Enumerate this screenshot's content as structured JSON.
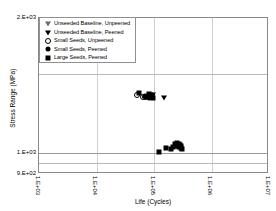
{
  "chart_data": {
    "type": "scatter",
    "title": "",
    "xlabel": "Life (Cycles)",
    "ylabel": "Stress Range (MPa)",
    "xscale": "log",
    "yscale": "log",
    "xlim": [
      1000,
      10000000
    ],
    "ylim": [
      900,
      2000
    ],
    "xticks": [
      "1.E+03",
      "1.E+04",
      "1.E+05",
      "1.E+06",
      "1.E+07"
    ],
    "xtick_values": [
      1000,
      10000,
      100000,
      1000000,
      10000000
    ],
    "yticks": [
      "2.E+03",
      "1.E+03",
      "9.E+02"
    ],
    "ytick_values": [
      2000,
      1000,
      900
    ],
    "grid": true,
    "gridlines_h": [
      1500,
      1000,
      950
    ],
    "gridlines_v": [
      10000,
      100000,
      1000000
    ],
    "legend_position": "upper-left",
    "series": [
      {
        "name": "Unseeded Baseline, Unpeened",
        "marker": "triangle-down-open",
        "points": []
      },
      {
        "name": "Unseeded Baseline, Peened",
        "marker": "triangle-down-filled",
        "points": [
          {
            "x": 150000,
            "y": 1330
          },
          {
            "x": 97000,
            "y": 1348
          }
        ]
      },
      {
        "name": "Small Seeds, Unpeened",
        "marker": "circle-open",
        "points": [
          {
            "x": 50500,
            "y": 1347
          },
          {
            "x": 64000,
            "y": 1337
          },
          {
            "x": 68500,
            "y": 1335
          }
        ]
      },
      {
        "name": "Small Seeds, Peened",
        "marker": "circle-filled",
        "points": [
          {
            "x": 71000,
            "y": 1340
          },
          {
            "x": 74000,
            "y": 1334
          },
          {
            "x": 77000,
            "y": 1345
          },
          {
            "x": 80000,
            "y": 1338
          },
          {
            "x": 83000,
            "y": 1330
          },
          {
            "x": 86000,
            "y": 1342
          },
          {
            "x": 88000,
            "y": 1333
          }
        ]
      },
      {
        "name": "Large Seeds, Peened",
        "marker": "square-filled",
        "points": [
          {
            "x": 55500,
            "y": 1360
          },
          {
            "x": 82000,
            "y": 1352
          },
          {
            "x": 85000,
            "y": 1344
          },
          {
            "x": 88000,
            "y": 1336
          },
          {
            "x": 90000,
            "y": 1349
          },
          {
            "x": 92000,
            "y": 1341
          },
          {
            "x": 94000,
            "y": 1332
          },
          {
            "x": 96000,
            "y": 1326
          },
          {
            "x": 122000,
            "y": 1005
          },
          {
            "x": 160000,
            "y": 1030
          },
          {
            "x": 196000,
            "y": 1025
          },
          {
            "x": 215000,
            "y": 1036
          },
          {
            "x": 232000,
            "y": 1048
          },
          {
            "x": 243000,
            "y": 1040
          },
          {
            "x": 252000,
            "y": 1055
          },
          {
            "x": 260000,
            "y": 1045
          },
          {
            "x": 268000,
            "y": 1033
          },
          {
            "x": 276000,
            "y": 1052
          },
          {
            "x": 284000,
            "y": 1042
          },
          {
            "x": 292000,
            "y": 1028
          },
          {
            "x": 300000,
            "y": 1038
          },
          {
            "x": 310000,
            "y": 1022
          }
        ]
      }
    ]
  },
  "legend": {
    "items": [
      {
        "label": "Unseeded Baseline, Unpeened",
        "marker": "triangle-down-open"
      },
      {
        "label": "Unseeded Baseline, Peened",
        "marker": "triangle-down-filled"
      },
      {
        "label": "Small Seeds, Unpeened",
        "marker": "circle-open"
      },
      {
        "label": "Small Seeds, Peened",
        "marker": "circle-filled"
      },
      {
        "label": "Large Seeds, Peened",
        "marker": "square-filled"
      }
    ]
  },
  "colors": {
    "marker": "#000000",
    "frame": "#8a8a8a",
    "grid": "#b9b9b9",
    "background": "#ffffff"
  }
}
